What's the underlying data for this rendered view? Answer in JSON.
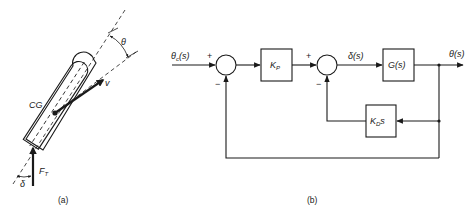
{
  "figure": {
    "panel_a": {
      "caption": "(a)",
      "labels": {
        "cg": "CG",
        "velocity": "v",
        "theta": "θ",
        "delta": "δ",
        "thrust_main": "F",
        "thrust_sub": "T"
      }
    },
    "panel_b": {
      "caption": "(b)",
      "input_signal": {
        "main": "θ",
        "sub": "c",
        "arg": "(s)"
      },
      "output_signal": "θ(s)",
      "intermediate_signal": "δ(s)",
      "summing_junction_1": {
        "plus": "+",
        "minus": "−"
      },
      "summing_junction_2": {
        "plus": "+",
        "minus": "−"
      },
      "blocks": {
        "proportional_gain": {
          "main": "K",
          "sub": "P"
        },
        "plant": "G(s)",
        "derivative_gain": {
          "main": "K",
          "sub": "D",
          "suffix": "s"
        }
      }
    }
  }
}
